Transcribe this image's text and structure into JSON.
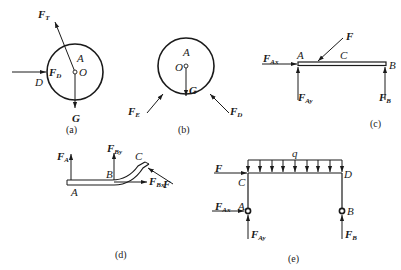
{
  "figure": {
    "panels": [
      {
        "id": "a",
        "caption": "(a)",
        "labels": {
          "force_t": "F",
          "force_t_sub": "T",
          "point_a": "A",
          "force_d": "F",
          "force_d_sub": "D",
          "center": "O",
          "point_d": "D",
          "weight": "G"
        }
      },
      {
        "id": "b",
        "caption": "(b)",
        "labels": {
          "point_a": "A",
          "center": "O",
          "weight": "G",
          "force_e": "F",
          "force_e_sub": "E",
          "force_d": "F",
          "force_d_sub": "D"
        }
      },
      {
        "id": "c",
        "caption": "(c)",
        "labels": {
          "force_ax": "F",
          "force_ax_sub": "Ax",
          "point_a": "A",
          "point_c": "C",
          "force": "F",
          "point_b": "B",
          "force_ay": "F",
          "force_ay_sub": "Ay",
          "force_b": "F",
          "force_b_sub": "B"
        }
      },
      {
        "id": "d",
        "caption": "(d)",
        "labels": {
          "force_a": "F",
          "force_a_sub": "A",
          "force_by": "F",
          "force_by_sub": "By",
          "point_c": "C",
          "force": "F",
          "point_b": "B",
          "force_bx": "F",
          "force_bx_sub": "Bx",
          "point_a": "A"
        }
      },
      {
        "id": "e",
        "caption": "(e)",
        "labels": {
          "load": "q",
          "force": "F",
          "point_c": "C",
          "point_d": "D",
          "force_ax": "F",
          "force_ax_sub": "Ax",
          "point_a": "A",
          "point_b": "B",
          "force_ay": "F",
          "force_ay_sub": "Ay",
          "force_b": "F",
          "force_b_sub": "B"
        }
      }
    ],
    "colors": {
      "ink": "#1a1a1a",
      "background": "#ffffff"
    }
  }
}
